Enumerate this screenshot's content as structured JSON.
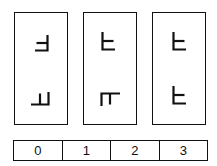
{
  "figure": {
    "type": "mental-rotation-test",
    "stroke_color": "#111111",
    "panels": [
      {
        "index": 1,
        "glyphs": [
          {
            "position": "top",
            "orientation": "mirrored",
            "rotation_deg": 0,
            "description": "vertical bar on right, two arms pointing left"
          },
          {
            "position": "bottom",
            "orientation": "mirrored",
            "rotation_deg": 90,
            "description": "horizontal bar at bottom, two arms pointing up"
          }
        ]
      },
      {
        "index": 2,
        "glyphs": [
          {
            "position": "top",
            "orientation": "normal",
            "rotation_deg": 0,
            "description": "vertical bar on left, two arms pointing right"
          },
          {
            "position": "bottom",
            "orientation": "normal",
            "rotation_deg": 90,
            "description": "horizontal bar at top, two arms pointing down"
          }
        ]
      },
      {
        "index": 3,
        "glyphs": [
          {
            "position": "top",
            "orientation": "normal",
            "rotation_deg": 0,
            "description": "vertical bar on left, two arms pointing right"
          },
          {
            "position": "bottom",
            "orientation": "normal",
            "rotation_deg": 0,
            "description": "vertical bar on left, two arms pointing right"
          }
        ]
      }
    ],
    "answer_scale": {
      "options": [
        "0",
        "1",
        "2",
        "3"
      ]
    }
  }
}
